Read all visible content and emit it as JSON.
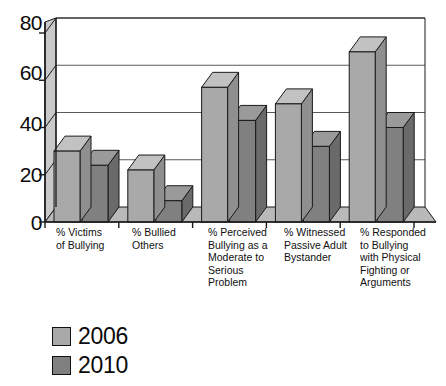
{
  "chart_data": {
    "type": "bar",
    "title": "",
    "xlabel": "",
    "ylabel": "",
    "ylim": [
      0,
      80
    ],
    "yticks": [
      0,
      20,
      40,
      60,
      80
    ],
    "grid": true,
    "legend_position": "bottom-left",
    "style": "3d-clustered-column",
    "categories": [
      "% Victims\nof Bullying",
      "% Bullied\nOthers",
      "% Perceived\nBullying as a\nModerate to\nSerious\nProblem",
      "% Witnessed\nPassive Adult\nBystander",
      "% Responded\nto Bullying\nwith Physical\nFighting or\nArguments"
    ],
    "series": [
      {
        "name": "2006",
        "color": "#a9a9a9",
        "values": [
          30,
          22,
          57,
          50,
          72
        ]
      },
      {
        "name": "2010",
        "color": "#808080",
        "values": [
          24,
          9,
          43,
          32,
          40
        ]
      }
    ]
  },
  "axis": {
    "ytick_labels": [
      "80",
      "60",
      "40",
      "20",
      "0"
    ]
  },
  "legend": {
    "items": [
      {
        "label": "2006",
        "color": "#a9a9a9"
      },
      {
        "label": "2010",
        "color": "#808080"
      }
    ]
  },
  "colors": {
    "series_2006": "#a9a9a9",
    "series_2010": "#808080",
    "series_2006_side": "#8f8f8f",
    "series_2010_side": "#6a6a6a",
    "series_2006_top": "#c2c2c2",
    "series_2010_top": "#9a9a9a",
    "wall": "#ffffff",
    "floor": "#b9b9b9",
    "left_wall": "#c9c9c9",
    "frame": "#1a1a1a",
    "gridline": "#5a5a5a",
    "text": "#0a0a0a"
  }
}
